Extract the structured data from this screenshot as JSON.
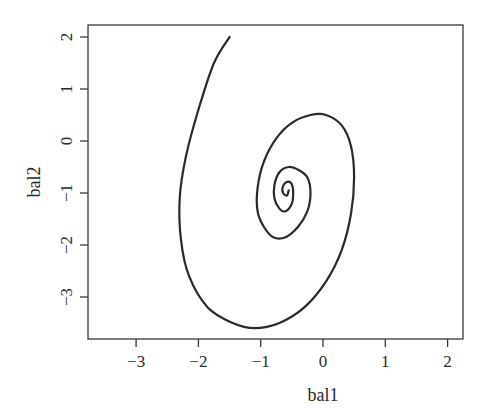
{
  "chart_data": {
    "type": "line",
    "title": "",
    "xlabel": "bal1",
    "ylabel": "bal2",
    "xlim": [
      -3.8,
      2.2
    ],
    "ylim": [
      -3.8,
      2.25
    ],
    "x_ticks": [
      -3,
      -2,
      -1,
      0,
      1,
      2
    ],
    "y_ticks": [
      -3,
      -2,
      -1,
      0,
      1,
      2
    ],
    "x_tick_labels": [
      "−3",
      "−2",
      "−1",
      "0",
      "1",
      "2"
    ],
    "y_tick_labels": [
      "−3",
      "−2",
      "−1",
      "0",
      "1",
      "2"
    ],
    "grid": false,
    "legend": null,
    "series": [
      {
        "name": "trajectory",
        "description": "Inward spiral (clockwise when viewed from start) starting at (-1.5, 2.0) and converging to a focus near (-0.55, -0.95)",
        "color": "#2a2a2a",
        "x": [
          -1.5,
          -1.75,
          -2.0,
          -2.2,
          -2.3,
          -2.28,
          -2.15,
          -1.85,
          -1.45,
          -1.1,
          -0.7,
          -0.3,
          0.05,
          0.3,
          0.45,
          0.5,
          0.45,
          0.3,
          0.05,
          -0.2,
          -0.5,
          -0.75,
          -0.95,
          -1.05,
          -1.05,
          -0.95,
          -0.8,
          -0.6,
          -0.4,
          -0.25,
          -0.2,
          -0.25,
          -0.4,
          -0.55,
          -0.7,
          -0.78,
          -0.78,
          -0.7,
          -0.6,
          -0.5,
          -0.48,
          -0.52,
          -0.6,
          -0.65,
          -0.64,
          -0.58,
          -0.55
        ],
        "y": [
          2.0,
          1.5,
          0.6,
          -0.3,
          -1.1,
          -1.9,
          -2.6,
          -3.2,
          -3.5,
          -3.6,
          -3.5,
          -3.2,
          -2.7,
          -2.1,
          -1.4,
          -0.7,
          -0.1,
          0.3,
          0.5,
          0.5,
          0.35,
          0.05,
          -0.4,
          -0.9,
          -1.35,
          -1.65,
          -1.85,
          -1.85,
          -1.65,
          -1.35,
          -1.0,
          -0.7,
          -0.55,
          -0.5,
          -0.6,
          -0.85,
          -1.1,
          -1.3,
          -1.35,
          -1.2,
          -0.95,
          -0.8,
          -0.8,
          -0.9,
          -1.0,
          -1.05,
          -0.95
        ]
      }
    ]
  },
  "axes": {
    "x_label": "bal1",
    "y_label": "bal2"
  }
}
